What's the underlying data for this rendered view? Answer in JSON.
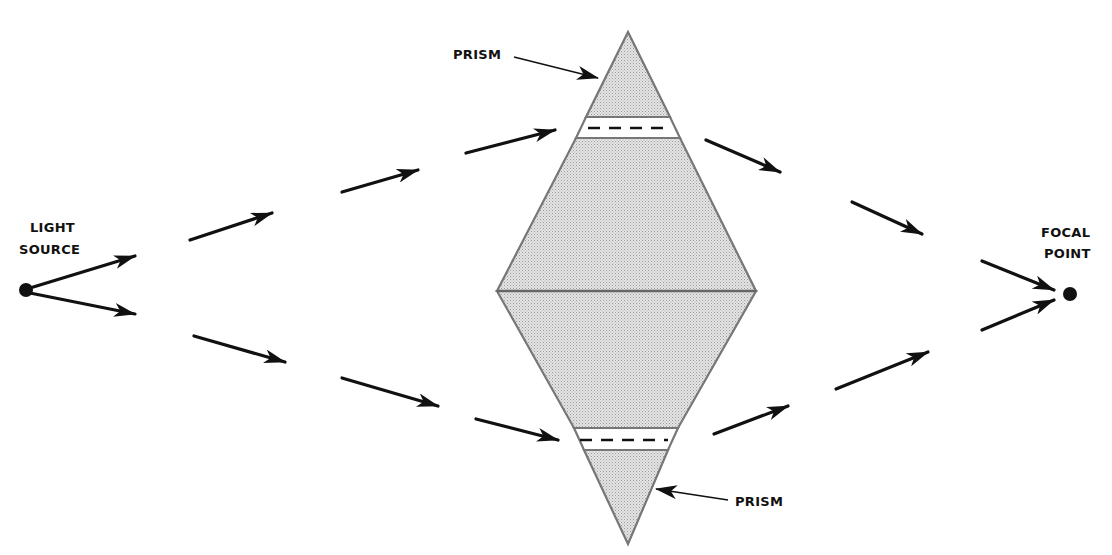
{
  "diagram": {
    "title": "",
    "labels": {
      "light_source": [
        "LIGHT",
        "SOURCE"
      ],
      "focal_point": [
        "FOCAL",
        "POINT"
      ],
      "prism_top": "PRISM",
      "prism_bottom": "PRISM"
    },
    "colors": {
      "ink": "#111111",
      "prism_fill": "#d9d9d9",
      "prism_edge": "#777777",
      "background": "#ffffff"
    },
    "nodes": [
      {
        "id": "light-source",
        "x": 26,
        "y": 290
      },
      {
        "id": "focal-point",
        "x": 1070,
        "y": 294
      }
    ],
    "prism": {
      "top": [
        628,
        32
      ],
      "left": [
        497,
        291
      ],
      "right": [
        756,
        291
      ],
      "bottom": [
        628,
        544
      ],
      "gap_top": {
        "y1": 117,
        "y2": 138
      },
      "gap_bottom": {
        "y1": 428,
        "y2": 450
      }
    },
    "ray_segments_upper": [
      [
        30,
        287,
        135,
        256
      ],
      [
        190,
        240,
        272,
        213
      ],
      [
        342,
        192,
        418,
        170
      ],
      [
        466,
        152,
        555,
        130
      ],
      [
        706,
        140,
        780,
        172
      ],
      [
        852,
        202,
        922,
        233
      ],
      [
        982,
        262,
        1055,
        290
      ]
    ],
    "ray_segments_lower": [
      [
        30,
        293,
        135,
        313
      ],
      [
        194,
        336,
        285,
        362
      ],
      [
        342,
        378,
        438,
        406
      ],
      [
        476,
        419,
        558,
        439
      ],
      [
        714,
        434,
        788,
        406
      ],
      [
        836,
        389,
        928,
        352
      ],
      [
        982,
        330,
        1055,
        300
      ]
    ]
  }
}
